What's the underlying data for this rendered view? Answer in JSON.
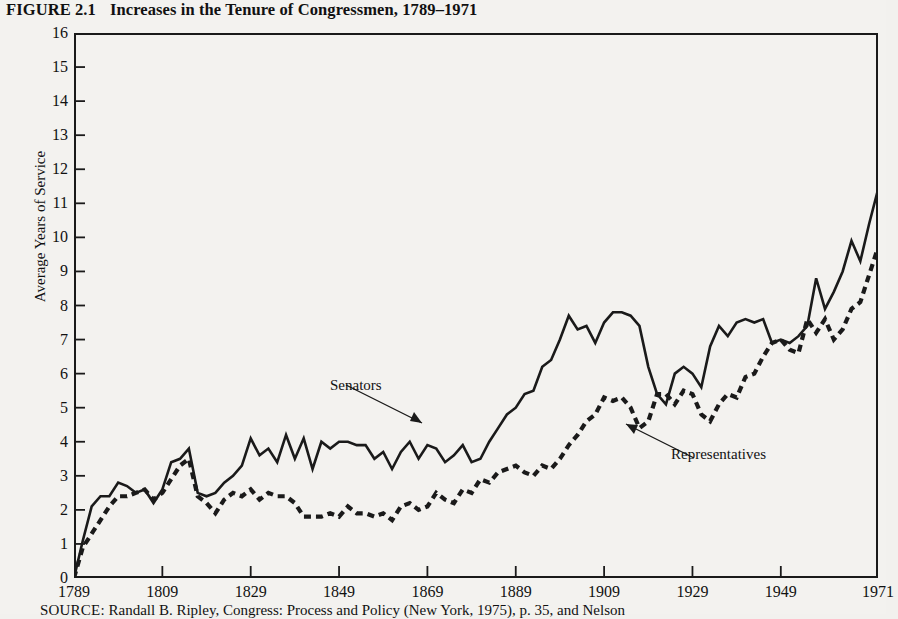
{
  "figure": {
    "label": "FIGURE 2.1",
    "title": "Increases in the Tenure of Congressmen, 1789–1971",
    "source_label": "SOURCE:",
    "source_text": "Randall B. Ripley, Congress: Process and Policy (New York, 1975), p. 35, and Nelson"
  },
  "annotations": {
    "senators": "Senators",
    "representatives": "Representatives"
  },
  "colors": {
    "ink": "#1a1a1a",
    "paper": "#f3f2ef"
  },
  "chart_data": {
    "type": "line",
    "title": "Increases in the Tenure of Congressmen, 1789–1971",
    "xlabel": "",
    "ylabel": "Average Years of Service",
    "xlim": [
      1789,
      1971
    ],
    "ylim": [
      0,
      16
    ],
    "grid": false,
    "legend_position": "inline-annotation",
    "xticks": [
      1789,
      1809,
      1829,
      1849,
      1869,
      1889,
      1909,
      1929,
      1949,
      1971
    ],
    "xtick_labels": [
      "1789",
      "1809",
      "1829",
      "1849",
      "1869",
      "1889",
      "1909",
      "1929",
      "1949",
      "1971"
    ],
    "yticks": [
      0,
      1,
      2,
      3,
      4,
      5,
      6,
      7,
      8,
      9,
      10,
      11,
      12,
      13,
      14,
      15,
      16
    ],
    "ytick_labels": [
      "0",
      "1",
      "2",
      "3",
      "4",
      "5",
      "6",
      "7",
      "8",
      "9",
      "10",
      "11",
      "12",
      "13",
      "14",
      "15",
      "16"
    ],
    "x": [
      1789,
      1791,
      1793,
      1795,
      1797,
      1799,
      1801,
      1803,
      1805,
      1807,
      1809,
      1811,
      1813,
      1815,
      1817,
      1819,
      1821,
      1823,
      1825,
      1827,
      1829,
      1831,
      1833,
      1835,
      1837,
      1839,
      1841,
      1843,
      1845,
      1847,
      1849,
      1851,
      1853,
      1855,
      1857,
      1859,
      1861,
      1863,
      1865,
      1867,
      1869,
      1871,
      1873,
      1875,
      1877,
      1879,
      1881,
      1883,
      1885,
      1887,
      1889,
      1891,
      1893,
      1895,
      1897,
      1899,
      1901,
      1903,
      1905,
      1907,
      1909,
      1911,
      1913,
      1915,
      1917,
      1919,
      1921,
      1923,
      1925,
      1927,
      1929,
      1931,
      1933,
      1935,
      1937,
      1939,
      1941,
      1943,
      1945,
      1947,
      1949,
      1951,
      1953,
      1955,
      1957,
      1959,
      1961,
      1963,
      1965,
      1967,
      1969,
      1971
    ],
    "series": [
      {
        "name": "Senators",
        "style": "solid",
        "color": "#1a1a1a",
        "values": [
          0.0,
          1.1,
          2.1,
          2.4,
          2.4,
          2.8,
          2.7,
          2.5,
          2.6,
          2.2,
          2.6,
          3.4,
          3.5,
          3.8,
          2.5,
          2.4,
          2.5,
          2.8,
          3.0,
          3.3,
          4.1,
          3.6,
          3.8,
          3.4,
          4.2,
          3.5,
          4.1,
          3.2,
          4.0,
          3.8,
          4.0,
          4.0,
          3.9,
          3.9,
          3.5,
          3.7,
          3.2,
          3.7,
          4.0,
          3.5,
          3.9,
          3.8,
          3.4,
          3.6,
          3.9,
          3.4,
          3.5,
          4.0,
          4.4,
          4.8,
          5.0,
          5.4,
          5.5,
          6.2,
          6.4,
          7.0,
          7.7,
          7.3,
          7.4,
          6.9,
          7.5,
          7.8,
          7.8,
          7.7,
          7.4,
          6.2,
          5.4,
          5.1,
          6.0,
          6.2,
          6.0,
          5.6,
          6.8,
          7.4,
          7.1,
          7.5,
          7.6,
          7.5,
          7.6,
          6.9,
          7.0,
          6.9,
          7.1,
          7.4,
          8.8,
          7.9,
          8.4,
          9.0,
          9.9,
          9.3,
          10.4,
          11.4
        ]
      },
      {
        "name": "Representatives",
        "style": "dashed",
        "color": "#1a1a1a",
        "values": [
          0.0,
          0.9,
          1.3,
          1.7,
          2.1,
          2.4,
          2.4,
          2.5,
          2.6,
          2.3,
          2.5,
          2.9,
          3.3,
          3.5,
          2.4,
          2.2,
          1.9,
          2.3,
          2.5,
          2.4,
          2.6,
          2.3,
          2.5,
          2.4,
          2.4,
          2.2,
          1.8,
          1.8,
          1.8,
          1.9,
          1.8,
          2.1,
          1.9,
          1.9,
          1.8,
          1.9,
          1.7,
          2.1,
          2.2,
          2.0,
          2.1,
          2.5,
          2.3,
          2.2,
          2.6,
          2.5,
          2.9,
          2.8,
          3.1,
          3.2,
          3.3,
          3.1,
          3.0,
          3.3,
          3.2,
          3.5,
          3.9,
          4.2,
          4.6,
          4.8,
          5.3,
          5.2,
          5.3,
          5.0,
          4.4,
          4.6,
          5.4,
          5.4,
          5.1,
          5.5,
          5.4,
          4.8,
          4.6,
          5.1,
          5.4,
          5.3,
          5.9,
          6.0,
          6.5,
          6.9,
          7.0,
          6.7,
          6.6,
          7.6,
          7.2,
          7.6,
          7.0,
          7.3,
          7.9,
          8.1,
          8.9,
          9.7
        ]
      }
    ],
    "annotations": [
      {
        "text": "Senators",
        "x_px": 330,
        "y_px": 377
      },
      {
        "text": "Representatives",
        "x_px": 671,
        "y_px": 446
      }
    ]
  }
}
